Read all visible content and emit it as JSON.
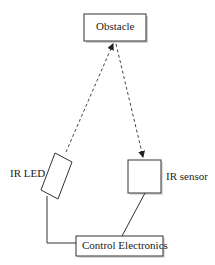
{
  "diagram": {
    "type": "block-diagram",
    "nodes": {
      "obstacle": {
        "label": "Obstacle"
      },
      "ir_led": {
        "label": "IR LED"
      },
      "ir_sensor": {
        "label": "IR sensor"
      },
      "control": {
        "label": "Control Electronics"
      }
    },
    "edges": [
      {
        "from": "ir_led",
        "to": "obstacle",
        "style": "dashed",
        "arrow": "end"
      },
      {
        "from": "obstacle",
        "to": "ir_sensor",
        "style": "dashed",
        "arrow": "end"
      },
      {
        "from": "ir_led",
        "to": "control",
        "style": "solid",
        "arrow": "none"
      },
      {
        "from": "ir_sensor",
        "to": "control",
        "style": "solid",
        "arrow": "none"
      }
    ]
  }
}
